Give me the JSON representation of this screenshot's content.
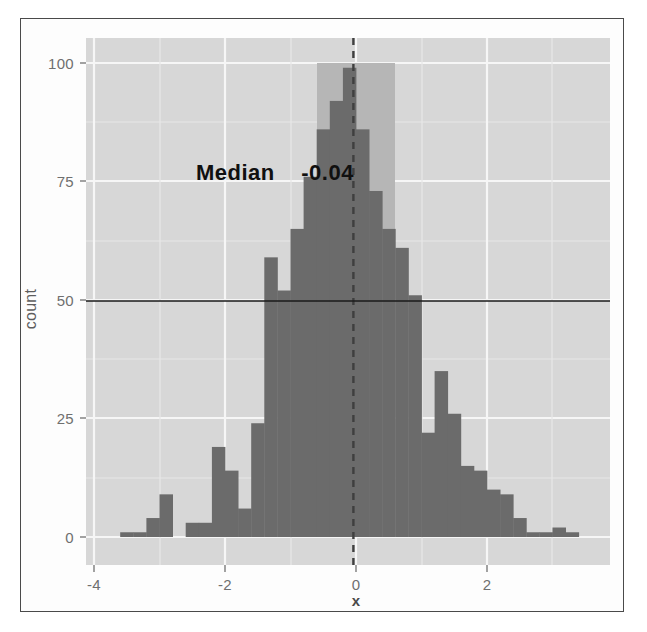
{
  "figure": {
    "type": "histogram-figure",
    "background_color": "#ffffff",
    "panel_color": "#d7d7d7",
    "grid_color": "#f5f5f5",
    "bar_color": "#6b6b6b",
    "highlight_band_color": "#b4b4b4",
    "median_line_color": "#3a3a3a",
    "reference_line_color": "#1c1c1c"
  },
  "annotations": {
    "median_label": "Median",
    "median_value": "-0.04",
    "median_text": "Median    -0.04"
  },
  "chart_data": {
    "type": "bar",
    "subtype": "histogram",
    "title": "",
    "xlabel": "x",
    "ylabel": "count",
    "xlim": [
      -4.0,
      3.4
    ],
    "ylim": [
      0,
      105
    ],
    "xticks": [
      -4,
      -2,
      0,
      2
    ],
    "xtick_labels": [
      "-4",
      "-2",
      "0",
      "2"
    ],
    "yticks": [
      0,
      25,
      50,
      75,
      100
    ],
    "ytick_labels": [
      "0",
      "25",
      "50",
      "75",
      "100"
    ],
    "grid": true,
    "legend": "none",
    "bin_width": 0.2,
    "bin_centers": [
      -3.5,
      -3.3,
      -3.1,
      -2.9,
      -2.7,
      -2.5,
      -2.3,
      -2.1,
      -1.9,
      -1.7,
      -1.5,
      -1.3,
      -1.1,
      -0.9,
      -0.7,
      -0.5,
      -0.3,
      -0.1,
      0.1,
      0.3,
      0.5,
      0.7,
      0.9,
      1.1,
      1.3,
      1.5,
      1.7,
      1.9,
      2.1,
      2.3,
      2.5,
      2.7,
      2.9,
      3.1,
      3.3
    ],
    "values": [
      1,
      1,
      4,
      9,
      0,
      3,
      3,
      19,
      14,
      6,
      24,
      59,
      52,
      65,
      76,
      86,
      92,
      99,
      86,
      73,
      65,
      61,
      51,
      22,
      35,
      26,
      15,
      14,
      10,
      9,
      4,
      1,
      1,
      2,
      1
    ],
    "categories": [
      "-3.5",
      "-3.3",
      "-3.1",
      "-2.9",
      "-2.7",
      "-2.5",
      "-2.3",
      "-2.1",
      "-1.9",
      "-1.7",
      "-1.5",
      "-1.3",
      "-1.1",
      "-0.9",
      "-0.7",
      "-0.5",
      "-0.3",
      "-0.1",
      "0.1",
      "0.3",
      "0.5",
      "0.7",
      "0.9",
      "1.1",
      "1.3",
      "1.5",
      "1.7",
      "1.9",
      "2.1",
      "2.3",
      "2.5",
      "2.7",
      "2.9",
      "3.1",
      "3.3"
    ],
    "reference_lines": [
      {
        "orientation": "horizontal",
        "value": 50,
        "style": "solid",
        "color": "#1c1c1c"
      },
      {
        "orientation": "vertical",
        "value": -0.04,
        "style": "dashed",
        "color": "#3a3a3a"
      }
    ],
    "highlight_band": {
      "orientation": "vertical",
      "x_from": -0.6,
      "x_to": 0.6,
      "y_from": 0,
      "y_to": 100
    }
  }
}
